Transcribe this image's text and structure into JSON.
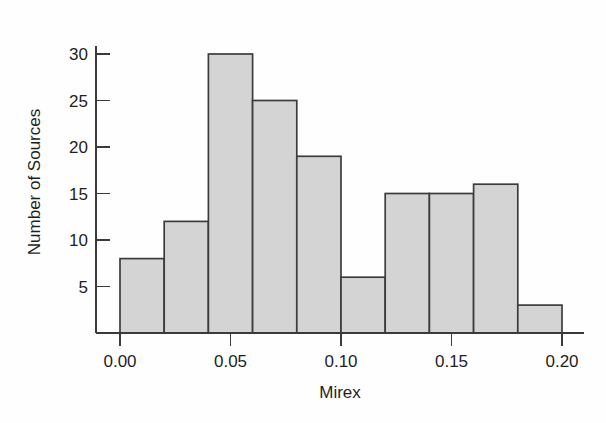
{
  "figure": {
    "name": "mirex-histogram",
    "background_color": "#fefefe",
    "bar_fill_color": "#d4d4d4",
    "bar_edge_color": "#3c3c3c",
    "axis_color": "#3a3a3a"
  },
  "chart_data": {
    "type": "bar",
    "title": "",
    "subtitle": "",
    "xlabel": "Mirex",
    "ylabel": "Number of Sources",
    "xlim": [
      0.0,
      0.2
    ],
    "ylim": [
      0,
      31
    ],
    "grid": false,
    "legend": false,
    "legend_position": "none",
    "bin_width": 0.02,
    "bin_edges": [
      0.0,
      0.02,
      0.04,
      0.06,
      0.08,
      0.1,
      0.12,
      0.14,
      0.16,
      0.18,
      0.2
    ],
    "categories": [
      "0.00-0.02",
      "0.02-0.04",
      "0.04-0.06",
      "0.06-0.08",
      "0.08-0.10",
      "0.10-0.12",
      "0.12-0.14",
      "0.14-0.16",
      "0.16-0.18",
      "0.18-0.20"
    ],
    "values": [
      8,
      12,
      30,
      25,
      19,
      6,
      15,
      15,
      16,
      3
    ],
    "total_count": 149,
    "xticks": [
      0.0,
      0.05,
      0.1,
      0.15,
      0.2
    ],
    "xtick_labels": [
      "0.00",
      "0.05",
      "0.10",
      "0.15",
      "0.20"
    ],
    "yticks": [
      5,
      10,
      15,
      20,
      25,
      30
    ],
    "ytick_labels": [
      "5",
      "10",
      "15",
      "20",
      "25",
      "30"
    ],
    "annotations": []
  },
  "geometry": {
    "x_origin_px": 120,
    "x_end_px": 562,
    "y_baseline_px": 333,
    "y_top_px": 46,
    "px_per_unit_y": 9.3,
    "px_per_bin_x": 44.2
  }
}
